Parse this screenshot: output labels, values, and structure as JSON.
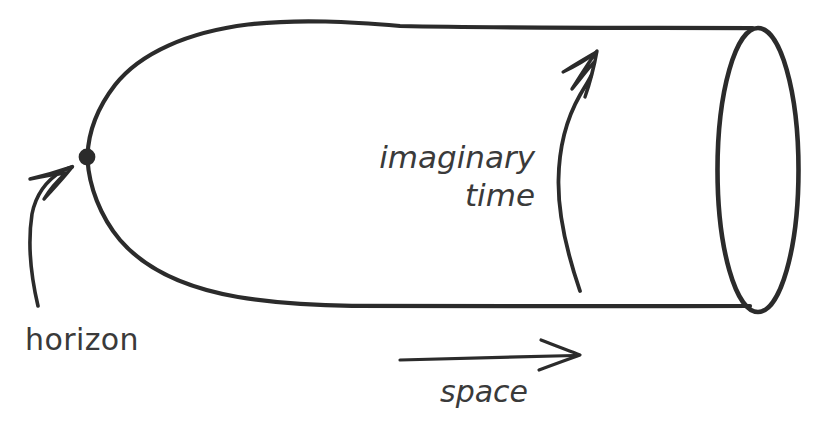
{
  "figure": {
    "kind": "hand-drawn-physics-diagram",
    "background_color": "#ffffff",
    "ink_color": "#2b2b2b",
    "text_color": "#3a3a3a",
    "canvas": {
      "width": 822,
      "height": 423
    }
  },
  "labels": {
    "horizon": "horizon",
    "imaginary_time_line1": "imaginary",
    "imaginary_time_line2": "time",
    "space": "space"
  },
  "annotations": {
    "horizon_point": {
      "name": "horizon-point",
      "shape": "filled-dot",
      "center_x": 87,
      "center_y": 157,
      "radius": 8
    },
    "horizon_pointer": {
      "name": "horizon-arrow",
      "from_x": 38,
      "from_y": 305,
      "to_x": 72,
      "to_y": 168,
      "style": "curved-hooked-arrow"
    },
    "imaginary_time_pointer": {
      "name": "imaginary-time-arrow",
      "from_x": 580,
      "from_y": 290,
      "to_x": 597,
      "to_y": 52,
      "style": "curved-hooked-arrow",
      "direction": "upward-around-circumference"
    },
    "space_pointer": {
      "name": "space-arrow",
      "from_x": 400,
      "from_y": 360,
      "to_x": 580,
      "to_y": 355,
      "style": "straight-open-v-arrow",
      "direction": "rightward"
    }
  },
  "shape": {
    "cigar_body": {
      "name": "cigar-outline",
      "tip_x": 87,
      "tip_y": 157,
      "top_line_y": 28,
      "bottom_line_y": 306,
      "open_end_x": 752
    },
    "end_cap": {
      "name": "cylinder-end-ellipse",
      "center_x": 758,
      "center_y": 170,
      "radius_x": 40,
      "radius_y": 142
    }
  }
}
